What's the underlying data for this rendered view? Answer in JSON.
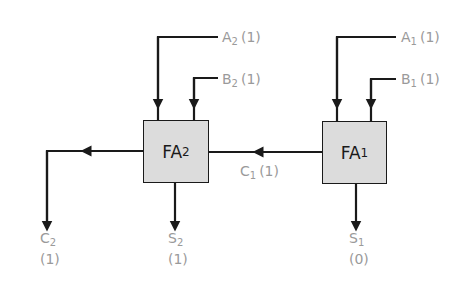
{
  "diagram": {
    "colors": {
      "wire": "#1a1a1a",
      "box_fill": "#dcdcdc",
      "label": "#9a9a9a"
    },
    "blocks": [
      {
        "id": "FA2",
        "name": "FA",
        "sub": "2"
      },
      {
        "id": "FA1",
        "name": "FA",
        "sub": "1"
      }
    ],
    "labels": {
      "a2": {
        "name": "A",
        "sub": "2",
        "value": "(1)"
      },
      "b2": {
        "name": "B",
        "sub": "2",
        "value": "(1)"
      },
      "a1": {
        "name": "A",
        "sub": "1",
        "value": "(1)"
      },
      "b1": {
        "name": "B",
        "sub": "1",
        "value": "(1)"
      },
      "c1": {
        "name": "C",
        "sub": "1",
        "value": "(1)"
      },
      "c2": {
        "name": "C",
        "sub": "2",
        "value": "(1)"
      },
      "s2": {
        "name": "S",
        "sub": "2",
        "value": "(1)"
      },
      "s1": {
        "name": "S",
        "sub": "1",
        "value": "(0)"
      }
    }
  }
}
